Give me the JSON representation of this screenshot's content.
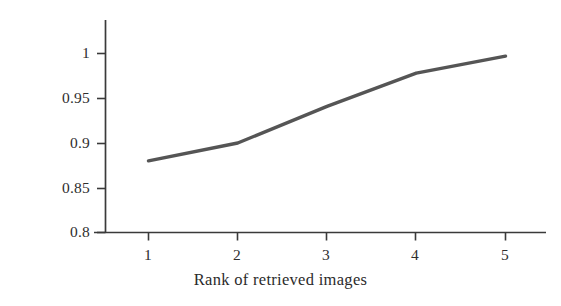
{
  "chart_data": {
    "type": "line",
    "title": "",
    "subtitle": "",
    "xlabel": "Rank of retrieved images",
    "ylabel": "Hit rate %",
    "x": [
      1,
      2,
      3,
      4,
      5
    ],
    "values": [
      0.88,
      0.9,
      0.941,
      0.978,
      0.997
    ],
    "series": [
      {
        "name": "Hit rate",
        "values": [
          0.88,
          0.9,
          0.941,
          0.978,
          0.997
        ]
      }
    ],
    "xlim": [
      0.7,
      5.45
    ],
    "ylim": [
      0.8,
      1.02
    ],
    "xticks": [
      1,
      2,
      3,
      4,
      5
    ],
    "yticks": [
      0.8,
      0.85,
      0.9,
      0.95,
      1
    ],
    "xtick_labels": [
      "1",
      "2",
      "3",
      "4",
      "5"
    ],
    "ytick_labels": [
      "0.8",
      "0.85",
      "0.9",
      "0.95",
      "1"
    ],
    "grid": false,
    "legend": false,
    "legend_position": "none",
    "line_color": "#555555",
    "axis_color": "#3a3a3a",
    "background_color": "#ffffff",
    "line_width": 3.4,
    "markers": false,
    "annotations": []
  },
  "axis": {
    "x_title": "Rank of retrieved images",
    "y_title": "Hit rate %"
  },
  "yticks": [
    {
      "label": "1"
    },
    {
      "label": "0.95"
    },
    {
      "label": "0.9"
    },
    {
      "label": "0.85"
    },
    {
      "label": "0.8"
    }
  ],
  "xticks": [
    {
      "label": "1"
    },
    {
      "label": "2"
    },
    {
      "label": "3"
    },
    {
      "label": "4"
    },
    {
      "label": "5"
    }
  ]
}
